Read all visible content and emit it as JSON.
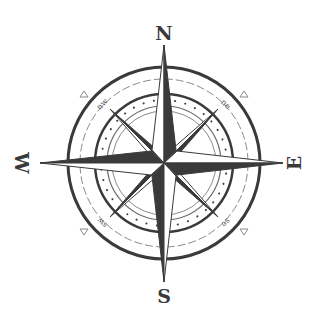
{
  "diagram": {
    "cardinal_labels": {
      "north": "N",
      "south": "S",
      "east": "E",
      "west": "W"
    },
    "intercardinal_labels": {
      "northwest": "nw",
      "northeast": "ne",
      "southwest": "sw",
      "southeast": "se"
    },
    "colors": {
      "ink": "#3a3a3a",
      "light_ink": "#8a8a8a",
      "background": "#ffffff"
    }
  }
}
